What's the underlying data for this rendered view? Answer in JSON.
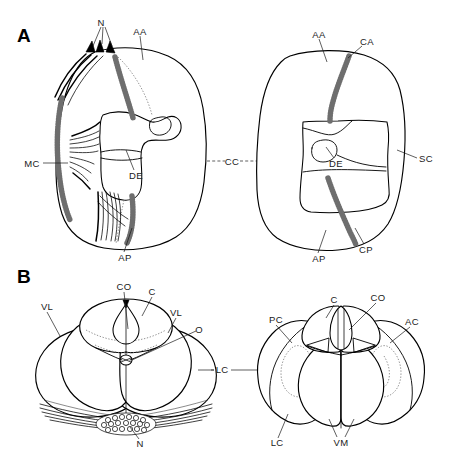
{
  "figure": {
    "background_color": "#ffffff",
    "ink_color": "#000000",
    "width": 450,
    "height": 460
  },
  "panels": [
    {
      "id": "A",
      "letter": "A",
      "description": "Two transverse sections drawn side by side, each a rounded quadrangular outline containing a central cavity; the left section bears muscle fiber bundles and stippled connective tissue on its lateral margin, the right section bears stippled anterior and posterior commissural bands.",
      "subviews": [
        {
          "id": "A-left",
          "description": "Left section with muscle bundles and stippled margin"
        },
        {
          "id": "A-right",
          "description": "Right section with anterior and posterior stippled bands"
        }
      ],
      "labels": [
        {
          "key": "N",
          "text": "N",
          "x": 101,
          "y": 22,
          "view": "A-left",
          "anchor": "middle"
        },
        {
          "key": "AA",
          "text": "AA",
          "x": 140,
          "y": 31,
          "view": "A-left",
          "anchor": "middle"
        },
        {
          "key": "MC",
          "text": "MC",
          "x": 32,
          "y": 163,
          "view": "A-left",
          "anchor": "middle"
        },
        {
          "key": "DE",
          "text": "DE",
          "x": 136,
          "y": 175,
          "view": "A-left",
          "anchor": "middle"
        },
        {
          "key": "AP",
          "text": "AP",
          "x": 125,
          "y": 257,
          "view": "A-left",
          "anchor": "middle"
        },
        {
          "key": "CC",
          "text": "CC",
          "x": 232,
          "y": 161,
          "view": "A-between",
          "anchor": "middle"
        },
        {
          "key": "AA",
          "text": "AA",
          "x": 319,
          "y": 34,
          "view": "A-right",
          "anchor": "middle"
        },
        {
          "key": "CA",
          "text": "CA",
          "x": 367,
          "y": 41,
          "view": "A-right",
          "anchor": "middle"
        },
        {
          "key": "DE",
          "text": "DE",
          "x": 336,
          "y": 163,
          "view": "A-right",
          "anchor": "middle"
        },
        {
          "key": "SC",
          "text": "SC",
          "x": 426,
          "y": 158,
          "view": "A-right",
          "anchor": "middle"
        },
        {
          "key": "AP",
          "text": "AP",
          "x": 319,
          "y": 258,
          "view": "A-right",
          "anchor": "middle"
        },
        {
          "key": "CP",
          "text": "CP",
          "x": 366,
          "y": 249,
          "view": "A-right",
          "anchor": "middle"
        }
      ]
    },
    {
      "id": "B",
      "letter": "B",
      "description": "Two views of a multi-lobed bilaterally symmetric structure; left is an oblique three-dimensional view with a fringe of fibers and a stippled nodule below, right is a frontal outline view with dotted internal contours in the lateral lobes.",
      "subviews": [
        {
          "id": "B-left",
          "description": "Oblique dorsal view with ciliary fringe and nodule"
        },
        {
          "id": "B-right",
          "description": "Frontal view with dotted internal outlines"
        }
      ],
      "labels": [
        {
          "key": "VL",
          "text": "VL",
          "x": 47,
          "y": 307,
          "view": "B-left",
          "anchor": "middle"
        },
        {
          "key": "CO",
          "text": "CO",
          "x": 124,
          "y": 287,
          "view": "B-left",
          "anchor": "middle"
        },
        {
          "key": "C",
          "text": "C",
          "x": 152,
          "y": 292,
          "view": "B-left",
          "anchor": "middle"
        },
        {
          "key": "VL",
          "text": "VL",
          "x": 176,
          "y": 313,
          "view": "B-left",
          "anchor": "middle"
        },
        {
          "key": "O",
          "text": "O",
          "x": 199,
          "y": 330,
          "view": "B-left",
          "anchor": "middle"
        },
        {
          "key": "N",
          "text": "N",
          "x": 140,
          "y": 444,
          "view": "B-left",
          "anchor": "middle"
        },
        {
          "key": "LC",
          "text": "LC",
          "x": 222,
          "y": 370,
          "view": "B-between",
          "anchor": "middle"
        },
        {
          "key": "PC",
          "text": "PC",
          "x": 276,
          "y": 320,
          "view": "B-right",
          "anchor": "middle"
        },
        {
          "key": "C",
          "text": "C",
          "x": 334,
          "y": 300,
          "view": "B-right",
          "anchor": "middle"
        },
        {
          "key": "CO",
          "text": "CO",
          "x": 378,
          "y": 298,
          "view": "B-right",
          "anchor": "middle"
        },
        {
          "key": "AC",
          "text": "AC",
          "x": 412,
          "y": 322,
          "view": "B-right",
          "anchor": "middle"
        },
        {
          "key": "LC",
          "text": "LC",
          "x": 277,
          "y": 443,
          "view": "B-right",
          "anchor": "middle"
        },
        {
          "key": "VM",
          "text": "VM",
          "x": 341,
          "y": 443,
          "view": "B-right",
          "anchor": "middle"
        }
      ]
    }
  ],
  "abbreviations": [
    "N",
    "AA",
    "MC",
    "DE",
    "AP",
    "CC",
    "CA",
    "SC",
    "CP",
    "VL",
    "CO",
    "C",
    "O",
    "LC",
    "PC",
    "AC",
    "VM"
  ]
}
